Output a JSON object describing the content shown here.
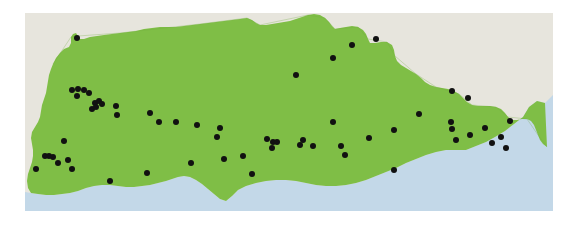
{
  "figure": {
    "type": "distribution-map",
    "region_name": "Andalusia",
    "title": "",
    "caption": "",
    "width": 565,
    "height": 226
  },
  "colors": {
    "land_region": "#7fbe46",
    "land_surrounding": "#e7e5dd",
    "sea": "#c3d8e8",
    "dot": "#111111",
    "page_background": "#ffffff",
    "coast_line": "#b7cbd9"
  },
  "map_frame": {
    "left": 25,
    "top": 13,
    "right": 553,
    "bottom": 211
  },
  "legend": {
    "items": [
      {
        "label": "Occurrence record",
        "symbol": "filled-circle",
        "color": "#111111"
      },
      {
        "label": "Study region",
        "symbol": "area-fill",
        "color": "#7fbe46"
      },
      {
        "label": "Sea",
        "symbol": "area-fill",
        "color": "#c3d8e8"
      }
    ]
  },
  "chart_data": {
    "type": "scatter",
    "title": "",
    "xlabel": "",
    "ylabel": "",
    "point_count": 62,
    "point_radius_px": 3,
    "xlim": [
      25,
      553
    ],
    "ylim": [
      13,
      211
    ],
    "grid": false,
    "points": [
      {
        "x": 77,
        "y": 38
      },
      {
        "x": 352,
        "y": 45
      },
      {
        "x": 376,
        "y": 39
      },
      {
        "x": 296,
        "y": 75
      },
      {
        "x": 333,
        "y": 58
      },
      {
        "x": 452,
        "y": 91
      },
      {
        "x": 468,
        "y": 98
      },
      {
        "x": 72,
        "y": 90
      },
      {
        "x": 78,
        "y": 89
      },
      {
        "x": 84,
        "y": 90
      },
      {
        "x": 77,
        "y": 96
      },
      {
        "x": 89,
        "y": 93
      },
      {
        "x": 95,
        "y": 103
      },
      {
        "x": 99,
        "y": 101
      },
      {
        "x": 102,
        "y": 104
      },
      {
        "x": 92,
        "y": 109
      },
      {
        "x": 96,
        "y": 107
      },
      {
        "x": 116,
        "y": 106
      },
      {
        "x": 117,
        "y": 115
      },
      {
        "x": 150,
        "y": 113
      },
      {
        "x": 159,
        "y": 122
      },
      {
        "x": 176,
        "y": 122
      },
      {
        "x": 197,
        "y": 125
      },
      {
        "x": 220,
        "y": 128
      },
      {
        "x": 217,
        "y": 137
      },
      {
        "x": 267,
        "y": 139
      },
      {
        "x": 273,
        "y": 142
      },
      {
        "x": 277,
        "y": 142
      },
      {
        "x": 272,
        "y": 148
      },
      {
        "x": 303,
        "y": 140
      },
      {
        "x": 300,
        "y": 145
      },
      {
        "x": 313,
        "y": 146
      },
      {
        "x": 341,
        "y": 146
      },
      {
        "x": 369,
        "y": 138
      },
      {
        "x": 394,
        "y": 130
      },
      {
        "x": 419,
        "y": 114
      },
      {
        "x": 451,
        "y": 122
      },
      {
        "x": 452,
        "y": 129
      },
      {
        "x": 456,
        "y": 140
      },
      {
        "x": 470,
        "y": 135
      },
      {
        "x": 485,
        "y": 128
      },
      {
        "x": 492,
        "y": 143
      },
      {
        "x": 501,
        "y": 137
      },
      {
        "x": 506,
        "y": 148
      },
      {
        "x": 510,
        "y": 121
      },
      {
        "x": 64,
        "y": 141
      },
      {
        "x": 45,
        "y": 156
      },
      {
        "x": 49,
        "y": 156
      },
      {
        "x": 53,
        "y": 157
      },
      {
        "x": 58,
        "y": 163
      },
      {
        "x": 68,
        "y": 160
      },
      {
        "x": 72,
        "y": 169
      },
      {
        "x": 36,
        "y": 169
      },
      {
        "x": 110,
        "y": 181
      },
      {
        "x": 147,
        "y": 173
      },
      {
        "x": 191,
        "y": 163
      },
      {
        "x": 224,
        "y": 159
      },
      {
        "x": 243,
        "y": 156
      },
      {
        "x": 252,
        "y": 174
      },
      {
        "x": 333,
        "y": 122
      },
      {
        "x": 345,
        "y": 155
      },
      {
        "x": 394,
        "y": 170
      }
    ]
  }
}
